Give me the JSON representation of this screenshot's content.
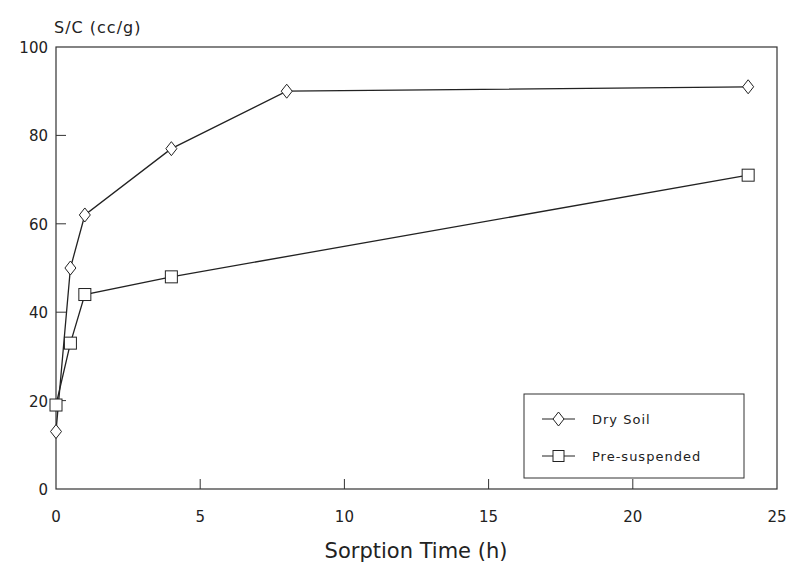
{
  "chart_data": {
    "type": "line",
    "title": "",
    "xlabel": "Sorption Time (h)",
    "ylabel": "S/C (cc/g)",
    "xlim": [
      0,
      25
    ],
    "ylim": [
      0,
      100
    ],
    "xticks": [
      0,
      5,
      10,
      15,
      20,
      25
    ],
    "yticks": [
      0,
      20,
      40,
      60,
      80,
      100
    ],
    "grid": false,
    "legend_position": "lower right",
    "series": [
      {
        "name": "Dry Soil",
        "marker": "diamond",
        "x": [
          0,
          0.5,
          1,
          4,
          8,
          24
        ],
        "values": [
          13,
          50,
          62,
          77,
          90,
          91
        ]
      },
      {
        "name": "Pre-suspended",
        "marker": "square",
        "x": [
          0,
          0.5,
          1,
          4,
          24
        ],
        "values": [
          19,
          33,
          44,
          48,
          71
        ]
      }
    ]
  }
}
